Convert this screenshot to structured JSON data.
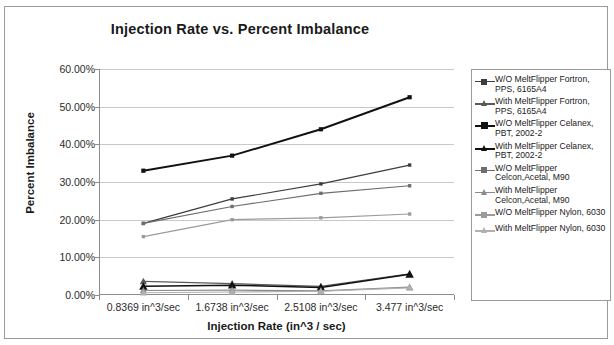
{
  "chart": {
    "title": "Injection Rate vs. Percent Imbalance",
    "xaxis_title": "Injection Rate (in^3 / sec)",
    "yaxis_title": "Percent Imbalance"
  },
  "chart_data": {
    "type": "line",
    "title": "Injection Rate vs. Percent Imbalance",
    "xlabel": "Injection Rate (in^3 / sec)",
    "ylabel": "Percent Imbalance",
    "categories": [
      "0.8369 in^3/sec",
      "1.6738 in^3/sec",
      "2.5108 in^3/sec",
      "3.477 in^3/sec"
    ],
    "x_values": [
      0.8369,
      1.6738,
      2.5108,
      3.477
    ],
    "ylim": [
      0,
      60
    ],
    "ytick_labels": [
      "0.00%",
      "10.00%",
      "20.00%",
      "30.00%",
      "40.00%",
      "50.00%",
      "60.00%"
    ],
    "ytick_values": [
      0,
      10,
      20,
      30,
      40,
      50,
      60
    ],
    "grid": true,
    "legend_position": "right",
    "units": "percent",
    "series": [
      {
        "name": "W/O MeltFlipper Fortron, PPS, 6165A4",
        "values": [
          19.0,
          25.5,
          29.5,
          34.5
        ],
        "marker": "square",
        "color": "#3d3d3d",
        "width": 1.2
      },
      {
        "name": "With MeltFlipper Fortron, PPS, 6165A4",
        "values": [
          3.6,
          3.0,
          2.3,
          5.6
        ],
        "marker": "triangle",
        "color": "#5a5a5a",
        "width": 1.2
      },
      {
        "name": "W/O MeltFlipper Celanex, PBT, 2002-2",
        "values": [
          33.0,
          37.0,
          44.0,
          52.5
        ],
        "marker": "square",
        "color": "#111111",
        "width": 1.9
      },
      {
        "name": "With MeltFlipper Celanex, PBT, 2002-2",
        "values": [
          2.3,
          2.6,
          2.0,
          5.5
        ],
        "marker": "triangle",
        "color": "#111111",
        "width": 1.5
      },
      {
        "name": "W/O MeltFlipper Celcon,Acetal, M90",
        "values": [
          19.0,
          23.5,
          27.0,
          29.0
        ],
        "marker": "square",
        "color": "#6e6e6e",
        "width": 1.2
      },
      {
        "name": "With MeltFlipper Celcon,Acetal, M90",
        "values": [
          1.2,
          1.3,
          1.1,
          2.1
        ],
        "marker": "triangle",
        "color": "#8a8a8a",
        "width": 1.2
      },
      {
        "name": "W/O MeltFlipper Nylon, 6030",
        "values": [
          15.5,
          20.0,
          20.5,
          21.5
        ],
        "marker": "square",
        "color": "#9b9b9b",
        "width": 1.2
      },
      {
        "name": "With MeltFlipper Nylon, 6030",
        "values": [
          0.6,
          0.8,
          1.0,
          1.9
        ],
        "marker": "triangle",
        "color": "#b0b0b0",
        "width": 1.2
      }
    ]
  }
}
